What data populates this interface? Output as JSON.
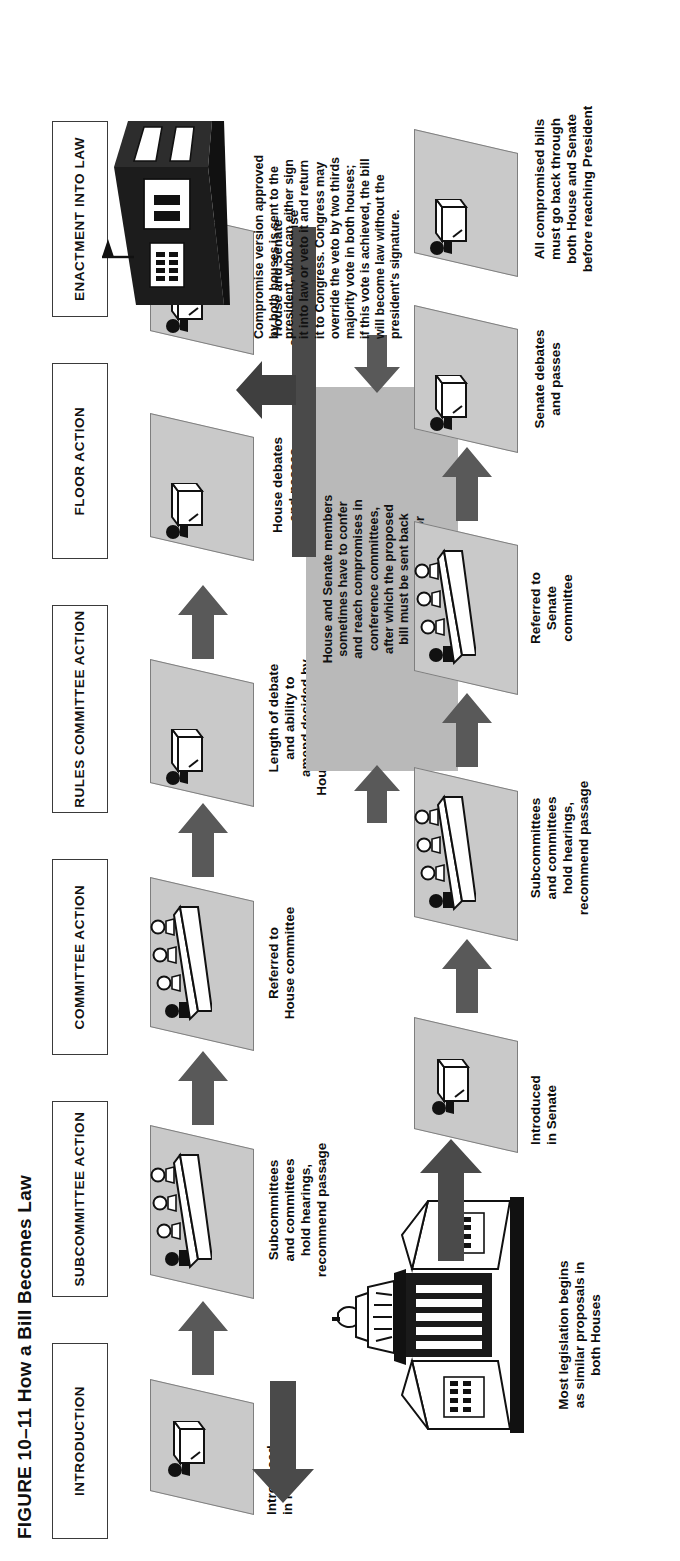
{
  "figure": {
    "title": "FIGURE 10–11  How a Bill Becomes Law",
    "orientation": "landscape-rotated-90ccw"
  },
  "headers": [
    {
      "id": "introduction",
      "label": "INTRODUCTION"
    },
    {
      "id": "subcommittee",
      "label": "SUBCOMMITTEE\nACTION"
    },
    {
      "id": "committee",
      "label": "COMMITTEE\nACTION"
    },
    {
      "id": "rules-committee",
      "label": "RULES COMMITTEE\nACTION"
    },
    {
      "id": "floor-action",
      "label": "FLOOR ACTION"
    },
    {
      "id": "enactment",
      "label": "ENACTMENT\nINTO LAW"
    }
  ],
  "house_track": {
    "stations": [
      {
        "id": "introduced-in-house",
        "caption": "Introduced\nin House"
      },
      {
        "id": "house-subcommittee",
        "caption": "Subcommittees\nand committees\nhold hearings,\nrecommend passage"
      },
      {
        "id": "referred-house-committee",
        "caption": "Referred to\nHouse committee"
      },
      {
        "id": "house-rules-committee",
        "caption": "Length of debate\nand ability to\namend decided by\nHouse Rules Committee"
      },
      {
        "id": "house-debates-passes",
        "caption": "House debates\nand passes"
      },
      {
        "id": "house-senate-approve",
        "caption": "House and Senate\napprove compromise"
      }
    ]
  },
  "senate_track": {
    "stations": [
      {
        "id": "introduced-in-senate",
        "caption": "Introduced\nin Senate"
      },
      {
        "id": "senate-subcommittee",
        "caption": "Subcommittees\nand committees\nhold hearings,\nrecommend passage"
      },
      {
        "id": "referred-senate-committee",
        "caption": "Referred to\nSenate\ncommittee"
      },
      {
        "id": "senate-debates-passes",
        "caption": "Senate debates\nand passes"
      },
      {
        "id": "all-compromised-bills",
        "caption": "All compromised bills\nmust go back through\nboth House and Senate\nbefore reaching President"
      }
    ]
  },
  "notes": {
    "origin": "Most legislation begins\nas similar proposals in\nboth Houses",
    "conference": "House and Senate members\nsometimes have to confer\nand reach compromises in\nconference committees,\nafter which the proposed\nbill must be sent back\nto both chambers for\ntheir approval",
    "president": "Compromise version approved\nby both houses is sent to the\npresident, who can either sign\nit into law or veto it and return\nit to Congress. Congress may\noverride the veto by two thirds\nmajority vote in both houses;\nif this vote is achieved, the bill\nwill become law without the\npresident's signature."
  },
  "icons": {
    "podium": "podium-icon",
    "committee_dais": "committee-dais-icon",
    "capitol": "capitol-building-icon",
    "white_house": "white-house-icon",
    "block_arrow": "block-arrow-icon"
  },
  "colors": {
    "parallelogram_fill": "#c9c9c9",
    "parallelogram_stroke": "#7e7e7e",
    "arrow_fill": "#595959",
    "conference_box_fill": "#b9b9b9",
    "dark_bar": "#4a4a4a",
    "text": "#111111",
    "page_background": "#ffffff"
  }
}
